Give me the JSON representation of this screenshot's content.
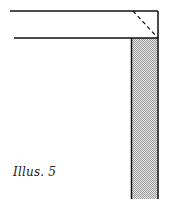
{
  "caption": "Illus. 5",
  "colors": {
    "line": "#111111",
    "shade_light": "#e8e8e8",
    "shade_dark": "#9a9a9a",
    "background": "#ffffff"
  },
  "diagram": {
    "horizontal_board": {
      "x1": 10,
      "x2": 158,
      "top_y": 11,
      "bottom_y": 38
    },
    "vertical_board": {
      "x": 131,
      "y": 38,
      "width": 27,
      "height": 161
    },
    "miter_line": {
      "x1": 133,
      "y1": 11,
      "x2": 158,
      "y2": 38,
      "style": "dashed"
    }
  }
}
